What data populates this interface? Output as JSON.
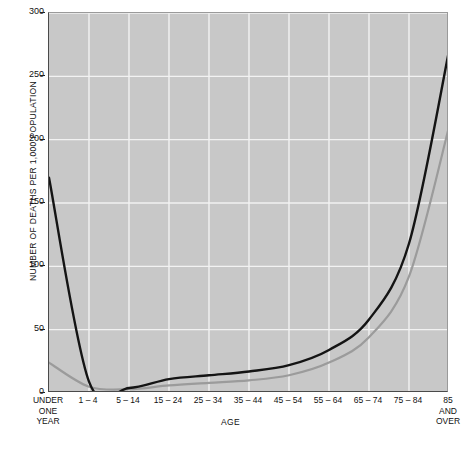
{
  "chart_data": {
    "type": "line",
    "title": "",
    "xlabel": "AGE",
    "ylabel": "NUMBER OF DEATHS PER 1,000 POPULATION",
    "ylim": [
      0,
      300
    ],
    "yticks": [
      0,
      50,
      100,
      150,
      200,
      250,
      300
    ],
    "ytick_labels": [
      "0",
      "50",
      "100",
      "150",
      "200",
      "250",
      "300"
    ],
    "grid": true,
    "legend": "none",
    "categories": [
      "UNDER ONE YEAR",
      "1 – 4",
      "5 – 14",
      "15 – 24",
      "25 – 34",
      "35 – 44",
      "45 – 54",
      "55 – 64",
      "65 – 74",
      "75 – 84",
      "85 AND OVER"
    ],
    "category_lines": [
      [
        "UNDER",
        "ONE",
        "YEAR"
      ],
      [
        "1 – 4"
      ],
      [
        "5 – 14"
      ],
      [
        "15 – 24"
      ],
      [
        "25 – 34"
      ],
      [
        "35 – 44"
      ],
      [
        "45 – 54"
      ],
      [
        "55 – 64"
      ],
      [
        "65 – 74"
      ],
      [
        "75 – 84"
      ],
      [
        "85",
        "AND",
        "OVER"
      ]
    ],
    "series": [
      {
        "name": "upper-curve",
        "color": "#141414",
        "values": [
          170,
          9,
          4,
          11,
          14,
          17,
          22,
          34,
          58,
          118,
          270
        ]
      },
      {
        "name": "lower-curve",
        "color": "#9b9b9b",
        "values": [
          24,
          5,
          3,
          6,
          8,
          10,
          14,
          24,
          44,
          92,
          210
        ]
      }
    ],
    "colors": {
      "plot_background": "#c8c8c8",
      "gridline": "#f2f2f2",
      "axis": "#4a4a4a",
      "text": "#111111",
      "page_background": "#ffffff"
    }
  },
  "caption": {
    "text": ""
  }
}
